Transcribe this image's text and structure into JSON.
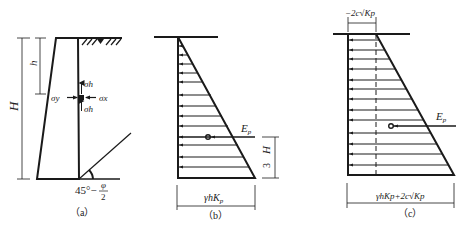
{
  "figure": {
    "panels": [
      {
        "id": "a",
        "caption": "（a）",
        "labels": {
          "H": "H",
          "h": "h",
          "sigma_h_top": "σh",
          "sigma_h_bottom": "σh",
          "sigma_y": "σy",
          "sigma_x": "σx",
          "angle": "45°−",
          "angle_num": "φ",
          "angle_den": "2"
        }
      },
      {
        "id": "b",
        "caption": "（b）",
        "labels": {
          "force": "Ep",
          "force_main": "E",
          "force_sub": "p",
          "height_num": "H",
          "height_den": "3",
          "base_width": "γhKp",
          "base_width_main": "γhK",
          "base_width_sub": "p"
        }
      },
      {
        "id": "c",
        "caption": "（c）",
        "labels": {
          "force_main": "E",
          "force_sub": "p",
          "top_width": "−2c√Kp",
          "base_width": "γhKp+2c√Kp"
        }
      }
    ],
    "colors": {
      "line": "#1a1a1a",
      "background": "#ffffff"
    }
  }
}
